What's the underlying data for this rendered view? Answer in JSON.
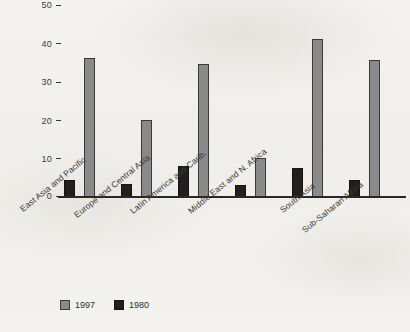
{
  "chart_data": {
    "type": "bar",
    "title": "",
    "subtitle": "",
    "xlabel": "",
    "ylabel": "",
    "ylim": [
      0,
      50
    ],
    "yticks": [
      0,
      10,
      20,
      30,
      40,
      50
    ],
    "grid": false,
    "legend_position": "bottom-left",
    "categories": [
      "East Asia and Pacific",
      "Europe and Central Asia",
      "Latin America and Carib.",
      "Middle East and N. Africa",
      "South Asia",
      "Sub-Saharan Africa"
    ],
    "series": [
      {
        "name": "1997",
        "color": "#8a8a8a",
        "values": [
          36,
          20,
          34.5,
          10,
          41,
          35.5
        ]
      },
      {
        "name": "1980",
        "color": "#231f1e",
        "values": [
          4.5,
          3.5,
          8,
          3,
          7.5,
          4.5
        ]
      }
    ],
    "bar_draw_order": [
      "1980",
      "1997"
    ]
  },
  "legend": {
    "items": [
      {
        "label": "1997",
        "swatch": "gray-swatch"
      },
      {
        "label": "1980",
        "swatch": "black-swatch"
      }
    ]
  },
  "axis": {
    "y_tick_labels": [
      "50",
      "40",
      "30",
      "20",
      "10",
      "0"
    ]
  }
}
